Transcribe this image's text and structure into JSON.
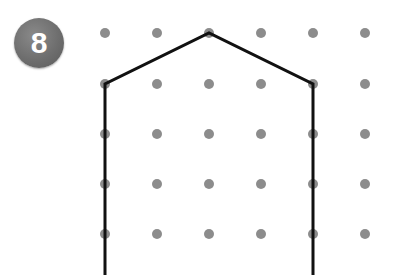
{
  "badge": {
    "number": "8",
    "color": "#6e6e6e",
    "text_color": "#ffffff"
  },
  "grid": {
    "columns_x": [
      105,
      157,
      209,
      261,
      313,
      365
    ],
    "rows_y": [
      33,
      84,
      134,
      184,
      234
    ],
    "dot_radius": 5,
    "dot_color": "#8c8c8c"
  },
  "shape": {
    "description": "Open pentagon-like outline (house shape) drawn on dot grid, open at bottom",
    "stroke_color": "#111111",
    "stroke_width": 3,
    "points": [
      [
        105,
        275
      ],
      [
        105,
        84
      ],
      [
        209,
        33
      ],
      [
        313,
        84
      ],
      [
        313,
        275
      ]
    ]
  }
}
